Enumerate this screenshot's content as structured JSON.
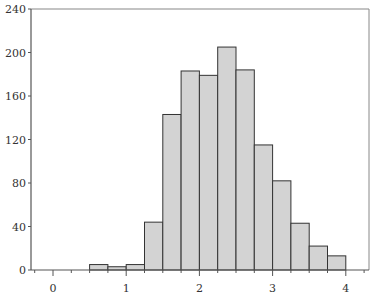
{
  "chart_data": {
    "type": "bar",
    "title": "",
    "xlabel": "",
    "ylabel": "",
    "xlim": [
      -0.3,
      4.3
    ],
    "ylim": [
      0,
      240
    ],
    "grid": false,
    "bin_width": 0.25,
    "bins": [
      {
        "x0": 0.5,
        "x1": 0.75,
        "count": 5
      },
      {
        "x0": 0.75,
        "x1": 1.0,
        "count": 3
      },
      {
        "x0": 1.0,
        "x1": 1.25,
        "count": 5
      },
      {
        "x0": 1.25,
        "x1": 1.5,
        "count": 44
      },
      {
        "x0": 1.5,
        "x1": 1.75,
        "count": 143
      },
      {
        "x0": 1.75,
        "x1": 2.0,
        "count": 183
      },
      {
        "x0": 2.0,
        "x1": 2.25,
        "count": 179
      },
      {
        "x0": 2.25,
        "x1": 2.5,
        "count": 205
      },
      {
        "x0": 2.5,
        "x1": 2.75,
        "count": 184
      },
      {
        "x0": 2.75,
        "x1": 3.0,
        "count": 115
      },
      {
        "x0": 3.0,
        "x1": 3.25,
        "count": 82
      },
      {
        "x0": 3.25,
        "x1": 3.5,
        "count": 43
      },
      {
        "x0": 3.5,
        "x1": 3.75,
        "count": 22
      },
      {
        "x0": 3.75,
        "x1": 4.0,
        "count": 13
      }
    ],
    "x_ticks": [
      0,
      1,
      2,
      3,
      4
    ],
    "x_tick_labels": [
      "0",
      "1",
      "2",
      "3",
      "4"
    ],
    "y_ticks": [
      0,
      40,
      80,
      120,
      160,
      200,
      240
    ],
    "y_tick_labels": [
      "0",
      "40",
      "80",
      "120",
      "160",
      "200",
      "240"
    ],
    "colors": {
      "bar_fill": "#d3d3d3",
      "bar_edge": "#333333",
      "axis": "#555555"
    }
  }
}
